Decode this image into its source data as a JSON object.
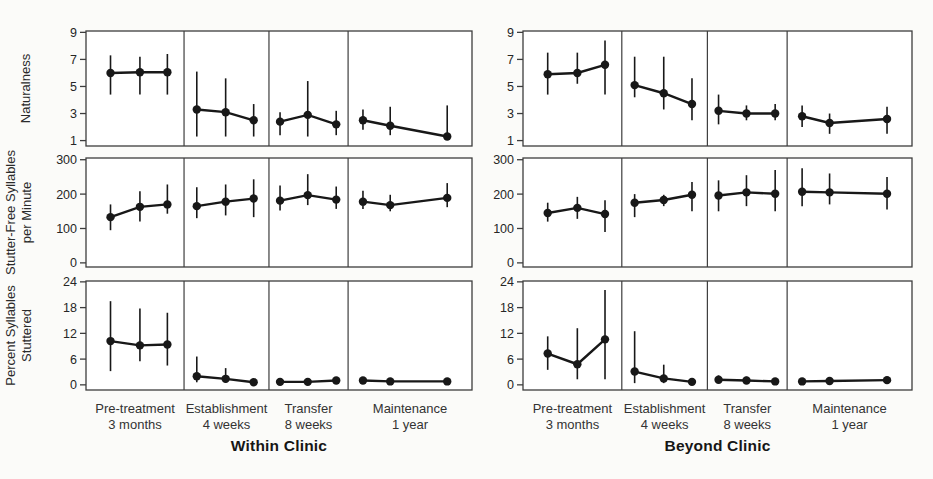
{
  "page": {
    "background_color": "#fbfbf9",
    "ink_color": "#181818",
    "frame_color": "#3d3d3d"
  },
  "chart_data": [
    {
      "type": "line",
      "title": "Within Clinic",
      "legend": "none",
      "grid": false,
      "phase_labels": [
        {
          "line1": "Pre-treatment",
          "line2": "3 months"
        },
        {
          "line1": "Establishment",
          "line2": "4 weeks"
        },
        {
          "line1": "Transfer",
          "line2": "8 weeks"
        },
        {
          "line1": "Maintenance",
          "line2": "1 year"
        }
      ],
      "phase_width_fracs": [
        0.254,
        0.22,
        0.205,
        0.321
      ],
      "point_x_fracs": [
        [
          0.25,
          0.55,
          0.83
        ],
        [
          0.15,
          0.49,
          0.82
        ],
        [
          0.14,
          0.49,
          0.85
        ],
        [
          0.12,
          0.34,
          0.8
        ]
      ],
      "rows": [
        {
          "measure": "Naturalness",
          "ylabel_lines": [
            "Naturalness"
          ],
          "yticks": [
            1,
            3,
            5,
            7,
            9
          ],
          "ylim": [
            0.6,
            9.1
          ],
          "phases": [
            {
              "phase": "Pre-treatment",
              "y": [
                6.0,
                6.05,
                6.05
              ],
              "err_lo": [
                4.4,
                4.4,
                4.4
              ],
              "err_hi": [
                7.3,
                7.2,
                7.4
              ]
            },
            {
              "phase": "Establishment",
              "y": [
                3.3,
                3.1,
                2.5
              ],
              "err_lo": [
                1.3,
                1.3,
                1.3
              ],
              "err_hi": [
                6.1,
                5.6,
                3.7
              ]
            },
            {
              "phase": "Transfer",
              "y": [
                2.4,
                2.9,
                2.2
              ],
              "err_lo": [
                1.4,
                1.3,
                1.4
              ],
              "err_hi": [
                3.1,
                5.4,
                3.2
              ]
            },
            {
              "phase": "Maintenance",
              "y": [
                2.5,
                2.1,
                1.3
              ],
              "err_lo": [
                1.8,
                1.4,
                1.1
              ],
              "err_hi": [
                3.3,
                3.5,
                3.6
              ]
            }
          ]
        },
        {
          "measure": "Stutter-Free Syllables per Minute",
          "ylabel_lines": [
            "Stutter-Free Syllables",
            "per Minute"
          ],
          "yticks": [
            0,
            100,
            200,
            300
          ],
          "ylim": [
            -12,
            305
          ],
          "phases": [
            {
              "phase": "Pre-treatment",
              "y": [
                133,
                163,
                170
              ],
              "err_lo": [
                95,
                120,
                143
              ],
              "err_hi": [
                170,
                208,
                228
              ]
            },
            {
              "phase": "Establishment",
              "y": [
                165,
                178,
                187
              ],
              "err_lo": [
                130,
                138,
                133
              ],
              "err_hi": [
                220,
                228,
                243
              ]
            },
            {
              "phase": "Transfer",
              "y": [
                181,
                197,
                184
              ],
              "err_lo": [
                152,
                168,
                157
              ],
              "err_hi": [
                225,
                258,
                222
              ]
            },
            {
              "phase": "Maintenance",
              "y": [
                178,
                168,
                189
              ],
              "err_lo": [
                157,
                150,
                162
              ],
              "err_hi": [
                210,
                198,
                232
              ]
            }
          ]
        },
        {
          "measure": "Percent Syllables Stuttered",
          "ylabel_lines": [
            "Percent Syllables",
            "Stuttered"
          ],
          "yticks": [
            0,
            6,
            12,
            18,
            24
          ],
          "ylim": [
            -1.2,
            24.2
          ],
          "phases": [
            {
              "phase": "Pre-treatment",
              "y": [
                10.2,
                9.2,
                9.4
              ],
              "err_lo": [
                3.2,
                5.5,
                4.5
              ],
              "err_hi": [
                19.5,
                17.8,
                16.8
              ]
            },
            {
              "phase": "Establishment",
              "y": [
                2.0,
                1.4,
                0.6
              ],
              "err_lo": [
                0.6,
                0.5,
                0.3
              ],
              "err_hi": [
                6.6,
                3.9,
                1.0
              ]
            },
            {
              "phase": "Transfer",
              "y": [
                0.7,
                0.7,
                1.0
              ],
              "err_lo": [
                0.4,
                0.4,
                0.5
              ],
              "err_hi": [
                1.3,
                1.5,
                1.7
              ]
            },
            {
              "phase": "Maintenance",
              "y": [
                1.0,
                0.8,
                0.8
              ],
              "err_lo": [
                1.0,
                0.8,
                0.8
              ],
              "err_hi": [
                1.0,
                0.8,
                0.8
              ]
            }
          ]
        }
      ]
    },
    {
      "type": "line",
      "title": "Beyond Clinic",
      "legend": "none",
      "grid": false,
      "phase_labels": [
        {
          "line1": "Pre-treatment",
          "line2": "3 months"
        },
        {
          "line1": "Establishment",
          "line2": "4 weeks"
        },
        {
          "line1": "Transfer",
          "line2": "8 weeks"
        },
        {
          "line1": "Maintenance",
          "line2": "1 year"
        }
      ],
      "phase_width_fracs": [
        0.254,
        0.22,
        0.205,
        0.321
      ],
      "point_x_fracs": [
        [
          0.25,
          0.55,
          0.83
        ],
        [
          0.15,
          0.49,
          0.82
        ],
        [
          0.14,
          0.49,
          0.85
        ],
        [
          0.12,
          0.34,
          0.8
        ]
      ],
      "rows": [
        {
          "measure": "Naturalness",
          "yticks": [
            1,
            3,
            5,
            7,
            9
          ],
          "ylim": [
            0.6,
            9.1
          ],
          "phases": [
            {
              "phase": "Pre-treatment",
              "y": [
                5.9,
                6.0,
                6.6
              ],
              "err_lo": [
                4.4,
                5.2,
                4.4
              ],
              "err_hi": [
                7.5,
                7.5,
                8.4
              ]
            },
            {
              "phase": "Establishment",
              "y": [
                5.1,
                4.5,
                3.7
              ],
              "err_lo": [
                4.2,
                3.3,
                2.5
              ],
              "err_hi": [
                7.2,
                7.2,
                5.6
              ]
            },
            {
              "phase": "Transfer",
              "y": [
                3.2,
                3.0,
                3.0
              ],
              "err_lo": [
                2.2,
                2.5,
                2.5
              ],
              "err_hi": [
                4.4,
                3.6,
                3.7
              ]
            },
            {
              "phase": "Maintenance",
              "y": [
                2.8,
                2.3,
                2.6
              ],
              "err_lo": [
                2.0,
                1.5,
                1.5
              ],
              "err_hi": [
                3.6,
                3.0,
                3.5
              ]
            }
          ]
        },
        {
          "measure": "Stutter-Free Syllables per Minute",
          "yticks": [
            0,
            100,
            200,
            300
          ],
          "ylim": [
            -12,
            305
          ],
          "phases": [
            {
              "phase": "Pre-treatment",
              "y": [
                145,
                160,
                142
              ],
              "err_lo": [
                120,
                128,
                90
              ],
              "err_hi": [
                175,
                192,
                182
              ]
            },
            {
              "phase": "Establishment",
              "y": [
                175,
                183,
                198
              ],
              "err_lo": [
                133,
                165,
                150
              ],
              "err_hi": [
                200,
                198,
                235
              ]
            },
            {
              "phase": "Transfer",
              "y": [
                196,
                205,
                201
              ],
              "err_lo": [
                150,
                165,
                150
              ],
              "err_hi": [
                240,
                255,
                270
              ]
            },
            {
              "phase": "Maintenance",
              "y": [
                207,
                205,
                201
              ],
              "err_lo": [
                165,
                170,
                155
              ],
              "err_hi": [
                275,
                260,
                250
              ]
            }
          ]
        },
        {
          "measure": "Percent Syllables Stuttered",
          "yticks": [
            0,
            6,
            12,
            18,
            24
          ],
          "ylim": [
            -1.2,
            24.2
          ],
          "phases": [
            {
              "phase": "Pre-treatment",
              "y": [
                7.3,
                4.8,
                10.6
              ],
              "err_lo": [
                3.5,
                1.3,
                1.3
              ],
              "err_hi": [
                11.3,
                13.2,
                22.1
              ]
            },
            {
              "phase": "Establishment",
              "y": [
                3.1,
                1.5,
                0.7
              ],
              "err_lo": [
                0.4,
                0.4,
                0.3
              ],
              "err_hi": [
                12.5,
                4.7,
                1.5
              ]
            },
            {
              "phase": "Transfer",
              "y": [
                1.2,
                1.0,
                0.8
              ],
              "err_lo": [
                0.6,
                0.5,
                0.4
              ],
              "err_hi": [
                2.2,
                1.9,
                1.2
              ]
            },
            {
              "phase": "Maintenance",
              "y": [
                0.8,
                0.9,
                1.1
              ],
              "err_lo": [
                0.8,
                0.9,
                1.1
              ],
              "err_hi": [
                0.8,
                0.9,
                1.1
              ]
            }
          ]
        }
      ]
    }
  ]
}
